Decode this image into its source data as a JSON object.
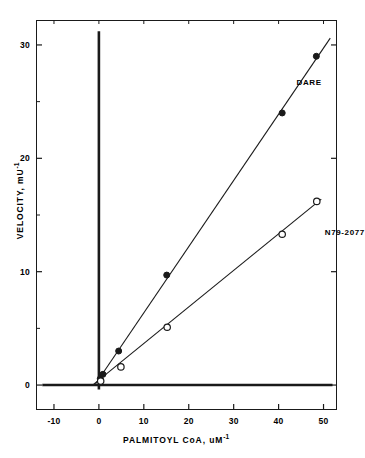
{
  "figure": {
    "background_color": "#ffffff",
    "ink_color": "#1a1a1a"
  },
  "axes": {
    "x": {
      "title_text": "PALMITOYL CoA, uM",
      "title_superscript": "-1",
      "ticks": [
        -10,
        0,
        10,
        20,
        30,
        40,
        50
      ],
      "tick_labels": [
        "-10",
        "0",
        "10",
        "20",
        "30",
        "40",
        "50"
      ],
      "min": -14,
      "max": 53
    },
    "y": {
      "title_text": "VELOCITY, mU",
      "title_superscript": "-1",
      "ticks": [
        0,
        10,
        20,
        30
      ],
      "tick_labels": [
        "0",
        "10",
        "20",
        "30"
      ],
      "minor_ticks": [
        5,
        15,
        25
      ],
      "min": -2.2,
      "max": 32.2
    }
  },
  "chart_data": {
    "type": "scatter",
    "title": "",
    "subtitle": "",
    "xlabel": "PALMITOYL CoA, uM-1",
    "ylabel": "VELOCITY, mU-1",
    "xlim": [
      -14,
      53
    ],
    "ylim": [
      -2.2,
      32.2
    ],
    "xticks": [
      -10,
      0,
      10,
      20,
      30,
      40,
      50
    ],
    "yticks": [
      0,
      10,
      20,
      30
    ],
    "grid": false,
    "legend": "inline-annotations",
    "plot_style": "lineweaver-burk double-reciprocal",
    "reference_lines": [
      {
        "name": "y-axis-heavy-line",
        "orientation": "vertical",
        "at": 0,
        "from": -0.4,
        "to": 31.2,
        "weight": "heavy"
      },
      {
        "name": "x-axis-heavy-line",
        "orientation": "horizontal",
        "at": 0,
        "from": -12.6,
        "to": 52.0,
        "weight": "heavy"
      }
    ],
    "series": [
      {
        "name": "DARE",
        "marker": "filled-circle",
        "label": "DARE",
        "label_x": 44.0,
        "label_y": 26.6,
        "fit_line": {
          "x0": -0.9,
          "y0": 0.0,
          "x1": 51.5,
          "y1": 30.6
        },
        "points": [
          {
            "x": 0.3,
            "y": 0.55
          },
          {
            "x": 0.9,
            "y": 0.95
          },
          {
            "x": 4.4,
            "y": 3.0
          },
          {
            "x": 15.1,
            "y": 9.7
          },
          {
            "x": 40.8,
            "y": 24.0
          },
          {
            "x": 48.4,
            "y": 29.0
          }
        ]
      },
      {
        "name": "N79-2077",
        "marker": "open-circle",
        "label": "N79-2077",
        "label_x": 50.3,
        "label_y": 13.4,
        "fit_line": {
          "x0": -1.4,
          "y0": 0.0,
          "x1": 49.5,
          "y1": 16.4
        },
        "points": [
          {
            "x": 0.4,
            "y": 0.35
          },
          {
            "x": 4.9,
            "y": 1.6
          },
          {
            "x": 15.2,
            "y": 5.1
          },
          {
            "x": 40.8,
            "y": 13.3
          },
          {
            "x": 48.5,
            "y": 16.2
          }
        ]
      }
    ]
  }
}
